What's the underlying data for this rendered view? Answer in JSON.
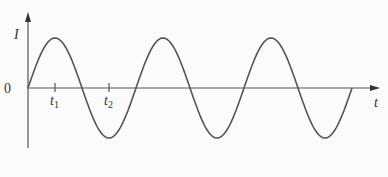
{
  "diagram": {
    "type": "sinusoid",
    "y_axis_label": "I",
    "x_axis_label": "t",
    "origin_label": "0",
    "ticks": [
      {
        "label": "t",
        "subscript": "1",
        "phase_fraction": 0.25
      },
      {
        "label": "t",
        "subscript": "2",
        "phase_fraction": 0.75
      }
    ],
    "cycles": 3,
    "curve_color": "#555555",
    "axis_color": "#555555"
  }
}
